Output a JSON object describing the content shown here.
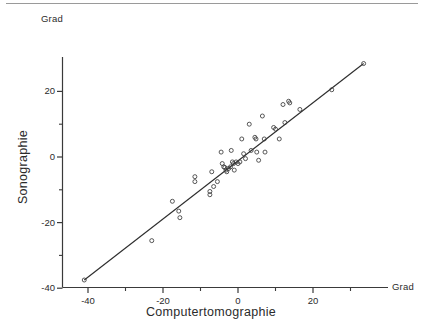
{
  "figure": {
    "top_rule": "horizontal-rule",
    "axis_titles": {
      "x": "Computertomographie",
      "y": "Sonographie"
    },
    "unit_labels": {
      "y_axis_unit": "Grad",
      "x_axis_unit": "Grad"
    }
  },
  "chart_data": {
    "type": "scatter",
    "title": "",
    "subtitle": "",
    "xlabel": "Computertomographie",
    "ylabel": "Sonographie",
    "x_unit": "Grad",
    "y_unit": "Grad",
    "xlim": [
      -48,
      38
    ],
    "ylim": [
      -46,
      32
    ],
    "xticks": [
      -40,
      -20,
      0,
      20
    ],
    "yticks": [
      -40,
      -20,
      0,
      20
    ],
    "xtick_labels": [
      "-40",
      "-20",
      "0",
      "20"
    ],
    "ytick_labels": [
      "-40",
      "-20",
      "0",
      "20"
    ],
    "xminor_ticks": [
      -30,
      -10,
      10,
      30
    ],
    "yminor_ticks": [
      -30,
      -10,
      10
    ],
    "grid": false,
    "legend": null,
    "marker": "open-circle",
    "series": [
      {
        "name": "Messpunkte",
        "points": [
          [
            -41.0,
            -37.5
          ],
          [
            -23.0,
            -25.5
          ],
          [
            -17.5,
            -13.5
          ],
          [
            -15.8,
            -16.5
          ],
          [
            -15.5,
            -18.5
          ],
          [
            -11.5,
            -6.0
          ],
          [
            -11.5,
            -7.5
          ],
          [
            -7.5,
            -10.5
          ],
          [
            -7.5,
            -11.5
          ],
          [
            -7.0,
            -4.5
          ],
          [
            -6.5,
            -9.0
          ],
          [
            -5.5,
            -7.5
          ],
          [
            -4.5,
            1.5
          ],
          [
            -4.2,
            -2.0
          ],
          [
            -3.8,
            -3.0
          ],
          [
            -3.5,
            -3.2
          ],
          [
            -3.2,
            -4.0
          ],
          [
            -3.0,
            -4.5
          ],
          [
            -2.5,
            -3.5
          ],
          [
            -2.0,
            -3.0
          ],
          [
            -1.8,
            2.0
          ],
          [
            -1.5,
            -1.5
          ],
          [
            -1.2,
            -2.0
          ],
          [
            -1.0,
            -4.0
          ],
          [
            -0.5,
            -1.5
          ],
          [
            0.0,
            -2.0
          ],
          [
            0.5,
            -1.5
          ],
          [
            1.0,
            5.5
          ],
          [
            1.5,
            1.0
          ],
          [
            2.0,
            -0.5
          ],
          [
            3.0,
            10.0
          ],
          [
            3.5,
            2.0
          ],
          [
            4.5,
            6.0
          ],
          [
            4.8,
            5.5
          ],
          [
            5.0,
            1.5
          ],
          [
            5.5,
            -1.0
          ],
          [
            6.5,
            12.5
          ],
          [
            7.0,
            5.5
          ],
          [
            7.2,
            1.5
          ],
          [
            9.5,
            9.0
          ],
          [
            10.0,
            8.5
          ],
          [
            11.0,
            5.5
          ],
          [
            12.0,
            16.0
          ],
          [
            12.5,
            10.5
          ],
          [
            13.5,
            17.0
          ],
          [
            13.8,
            16.5
          ],
          [
            16.5,
            14.5
          ],
          [
            25.0,
            20.5
          ],
          [
            33.5,
            28.5
          ]
        ]
      }
    ],
    "fit_line": {
      "name": "Regressionsgerade",
      "x_start": -41.0,
      "y_start": -37.5,
      "x_end": 33.5,
      "y_end": 28.5
    }
  }
}
